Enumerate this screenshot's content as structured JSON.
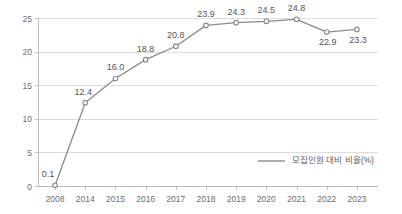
{
  "chart_data": {
    "type": "line",
    "title": "",
    "subtitle": "",
    "xlabel": "",
    "ylabel": "",
    "categories": [
      "2008",
      "2014",
      "2015",
      "2016",
      "2017",
      "2018",
      "2019",
      "2020",
      "2021",
      "2022",
      "2023"
    ],
    "series": [
      {
        "name": "모집인원 대비 비율(%)",
        "values": [
          0.1,
          12.4,
          16.0,
          18.8,
          20.8,
          23.9,
          24.3,
          24.5,
          24.8,
          22.9,
          23.3
        ],
        "labels": [
          "0.1",
          "12.4",
          "16.0",
          "18.8",
          "20.8",
          "23.9",
          "24.3",
          "24.5",
          "24.8",
          "22.9",
          "23.3"
        ],
        "color": "#8a8a8a",
        "marker": "open-circle"
      }
    ],
    "ylim": [
      0,
      25
    ],
    "yticks": [
      0,
      5,
      10,
      15,
      20,
      25
    ],
    "ytick_labels": [
      "0",
      "5",
      "10",
      "15",
      "20",
      "25"
    ],
    "grid": true,
    "grid_axis": "y",
    "legend_position": "bottom-right",
    "legend_entries": [
      "모집인원 대비 비율(%)"
    ],
    "background_color": "#ffffff",
    "gridline_color": "#dcdcdc",
    "axis_color": "#bdbdbd",
    "label_color": "#555555",
    "tick_color": "#6e6e6e"
  },
  "legend": {
    "entries": [
      {
        "label": "모집인원 대비 비율(%)",
        "color": "#8a8a8a"
      }
    ]
  }
}
